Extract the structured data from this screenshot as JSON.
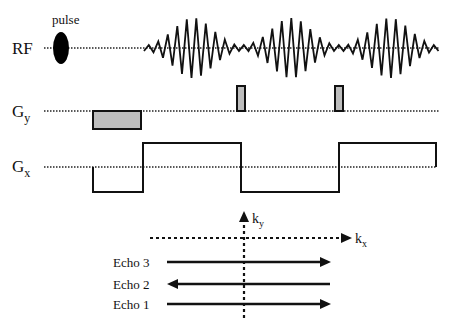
{
  "labels": {
    "pulse": "pulse",
    "rf": "RF",
    "gy_main": "G",
    "gy_sub": "y",
    "gx_main": "G",
    "gx_sub": "x",
    "ky_main": "k",
    "ky_sub": "y",
    "kx_main": "k",
    "kx_sub": "x",
    "echo3": "Echo 3",
    "echo2": "Echo 2",
    "echo1": "Echo 1"
  },
  "colors": {
    "line": "#111111",
    "gradient_fill": "#bdbdbd",
    "background": "#ffffff"
  },
  "diagram": {
    "rows": [
      "RF",
      "Gy",
      "Gx"
    ],
    "echo_directions": {
      "Echo 1": "right",
      "Echo 2": "left",
      "Echo 3": "right"
    }
  }
}
